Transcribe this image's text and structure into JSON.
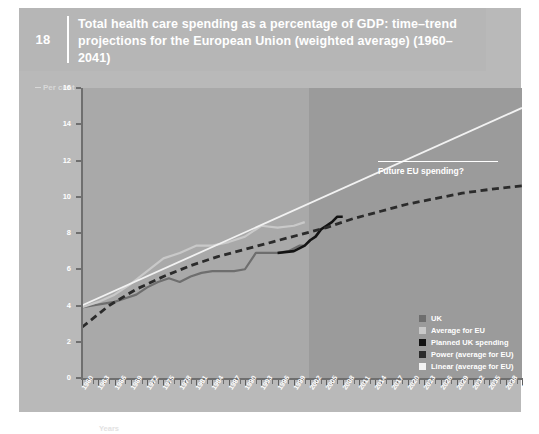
{
  "header": {
    "number": "18",
    "title": "Total health care spending as a percentage of GDP: time–trend projections for the European Union (weighted average) (1960–2041)"
  },
  "axes": {
    "y_label": "Per cent",
    "x_label": "Years"
  },
  "annotation": {
    "future_label": "Future EU spending?"
  },
  "legend": {
    "items": [
      {
        "label": "UK",
        "color": "#6e6e6e"
      },
      {
        "label": "Average for EU",
        "color": "#c9c9c9"
      },
      {
        "label": "Planned UK spending",
        "color": "#131313"
      },
      {
        "label": "Power (average for EU)",
        "color": "#2b2b2b"
      },
      {
        "label": "Linear (average for EU)",
        "color": "#f2f2f2"
      }
    ]
  },
  "chart_data": {
    "type": "line",
    "title": "Total health care spending as a percentage of GDP: time–trend projections for the European Union (weighted average) (1960–2041)",
    "xlabel": "Years",
    "ylabel": "Per cent",
    "xlim": [
      1960,
      2041
    ],
    "ylim": [
      0,
      16
    ],
    "yticks": [
      0,
      2,
      4,
      6,
      8,
      10,
      12,
      14,
      16
    ],
    "xticks": [
      1960,
      1963,
      1966,
      1969,
      1972,
      1975,
      1978,
      1981,
      1984,
      1987,
      1990,
      1993,
      1996,
      1999,
      2002,
      2005,
      2008,
      2011,
      2014,
      2017,
      2020,
      2023,
      2026,
      2029,
      2032,
      2035,
      2038,
      2041
    ],
    "grid": false,
    "legend_position": "inside-bottom-right",
    "shaded_region": {
      "from": 2001,
      "to": 2041,
      "meaning": "projection period"
    },
    "series": [
      {
        "name": "UK",
        "color": "#6e6e6e",
        "style": "solid",
        "x": [
          1960,
          1962,
          1964,
          1966,
          1968,
          1970,
          1972,
          1974,
          1976,
          1978,
          1980,
          1982,
          1984,
          1986,
          1988,
          1990,
          1992,
          1994,
          1996,
          1998,
          2000,
          2001
        ],
        "y": [
          3.9,
          4.0,
          4.1,
          4.2,
          4.4,
          4.6,
          5.0,
          5.3,
          5.5,
          5.3,
          5.6,
          5.8,
          5.9,
          5.9,
          5.9,
          6.0,
          6.9,
          6.9,
          6.9,
          7.0,
          7.3,
          7.3
        ]
      },
      {
        "name": "Average for EU",
        "color": "#c9c9c9",
        "style": "solid",
        "x": [
          1960,
          1963,
          1966,
          1969,
          1972,
          1975,
          1978,
          1981,
          1984,
          1987,
          1990,
          1993,
          1996,
          1999,
          2001
        ],
        "y": [
          3.9,
          4.2,
          4.6,
          5.2,
          5.9,
          6.6,
          6.9,
          7.3,
          7.3,
          7.5,
          7.8,
          8.4,
          8.3,
          8.4,
          8.6
        ]
      },
      {
        "name": "Planned UK spending",
        "color": "#131313",
        "style": "solid",
        "x": [
          1996,
          1999,
          2001,
          2002,
          2003,
          2004,
          2005,
          2006,
          2007,
          2008
        ],
        "y": [
          6.9,
          7.0,
          7.3,
          7.6,
          7.8,
          8.2,
          8.4,
          8.6,
          8.9,
          8.9
        ]
      },
      {
        "name": "Power (average for EU)",
        "color": "#2b2b2b",
        "style": "dashed",
        "x": [
          1960,
          1965,
          1970,
          1975,
          1980,
          1985,
          1990,
          1995,
          2000,
          2005,
          2010,
          2015,
          2020,
          2025,
          2030,
          2035,
          2041
        ],
        "y": [
          2.8,
          4.0,
          4.9,
          5.6,
          6.2,
          6.7,
          7.1,
          7.5,
          7.9,
          8.3,
          8.8,
          9.2,
          9.6,
          9.9,
          10.2,
          10.4,
          10.6
        ]
      },
      {
        "name": "Linear (average for EU)",
        "color": "#f2f2f2",
        "style": "solid",
        "x": [
          1960,
          2041
        ],
        "y": [
          4.0,
          14.9
        ]
      }
    ]
  }
}
